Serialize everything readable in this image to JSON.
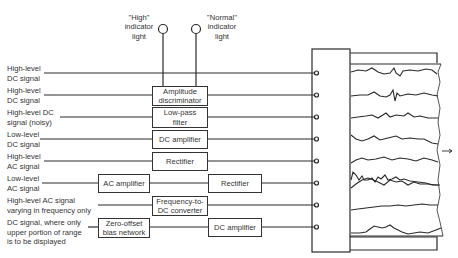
{
  "indicators": {
    "high": {
      "line1": "\"High\"",
      "line2": "indicator",
      "line3": "light"
    },
    "normal": {
      "line1": "\"Normal\"",
      "line2": "indicator",
      "line3": "light"
    }
  },
  "inputs": [
    {
      "line1": "High-level",
      "line2": "DC signal"
    },
    {
      "line1": "High-level",
      "line2": "DC signal"
    },
    {
      "line1": "High-level DC",
      "line2": "signal (noisy)"
    },
    {
      "line1": "Low-level",
      "line2": "DC signal"
    },
    {
      "line1": "High-level",
      "line2": "AC signal"
    },
    {
      "line1": "Low-level",
      "line2": "AC signal"
    },
    {
      "line1": "High-level AC signal",
      "line2": "varying in frequency only"
    },
    {
      "line1": "DC signal, where only",
      "line2": "upper portion of range",
      "line3": "is to be displayed"
    }
  ],
  "blocks": {
    "amplitude_discriminator": {
      "line1": "Amplitude",
      "line2": "discriminator"
    },
    "low_pass_filter": {
      "line1": "Low-pass",
      "line2": "filter"
    },
    "dc_amplifier_1": {
      "line1": "DC amplifier"
    },
    "rectifier_1": {
      "line1": "Rectifier"
    },
    "ac_amplifier": {
      "line1": "AC amplifier"
    },
    "rectifier_2": {
      "line1": "Rectifier"
    },
    "frequency_converter": {
      "line1": "Frequency-to-",
      "line2": "DC converter"
    },
    "zero_offset": {
      "line1": "Zero-offset",
      "line2": "bias network"
    },
    "dc_amplifier_2": {
      "line1": "DC amplifier"
    }
  },
  "recorder": {
    "channels": 8,
    "paper_direction": "right-arrow"
  }
}
